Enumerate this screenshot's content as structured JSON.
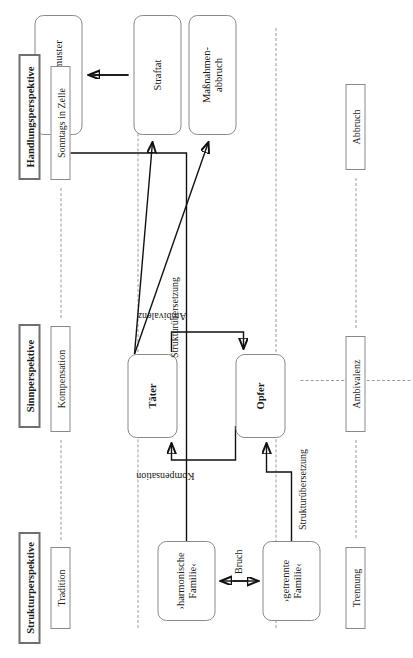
{
  "diagram": {
    "orientation": "rotated-90",
    "perspectives": [
      {
        "id": "struktur",
        "label": "Strukturperspektive"
      },
      {
        "id": "sinn",
        "label": "Sinnperspektive"
      },
      {
        "id": "handlung",
        "label": "Handlungsperspektive"
      }
    ],
    "left_chips": [
      {
        "id": "tradition",
        "label": "Tradition"
      },
      {
        "id": "kompensation-chip",
        "label": "Kompensation"
      },
      {
        "id": "sonntags",
        "label": "Sonntags in Zelle"
      }
    ],
    "right_chips": [
      {
        "id": "trennung",
        "label": "Trennung"
      },
      {
        "id": "ambivalenz-chip",
        "label": "Ambivalenz"
      },
      {
        "id": "abbruch",
        "label": "Abbruch"
      }
    ],
    "nodes": [
      {
        "id": "harmonische-familie",
        "label": "›harmonische Familie‹",
        "bold": false,
        "lines": [
          "›harmonische",
          "Familie‹"
        ]
      },
      {
        "id": "getrennte-familie",
        "label": "›getrennte Familie‹",
        "bold": false,
        "lines": [
          "›getrennte",
          "Familie‹"
        ]
      },
      {
        "id": "opfer",
        "label": "Opfer",
        "bold": true,
        "lines": [
          "Opfer"
        ]
      },
      {
        "id": "taeter",
        "label": "Täter",
        "bold": true,
        "lines": [
          "Täter"
        ]
      },
      {
        "id": "isolationsmuster",
        "label": "Isolationsmuster",
        "bold": false,
        "lines": [
          "Isolationsmuster"
        ]
      },
      {
        "id": "straftat",
        "label": "Straftat",
        "bold": false,
        "lines": [
          "Straftat"
        ]
      },
      {
        "id": "massnahmenabbruch",
        "label": "Maßnahmen-abbruch",
        "bold": false,
        "lines": [
          "Maßnahmen-",
          "abbruch"
        ]
      }
    ],
    "edge_labels": [
      {
        "id": "bruch",
        "label": "Bruch"
      },
      {
        "id": "strukturuebersetzung-links",
        "label": "Strukturübersetzung"
      },
      {
        "id": "strukturuebersetzung-rechts",
        "label": "Strukturübersetzung"
      },
      {
        "id": "kompensation",
        "label": "Kompensation"
      },
      {
        "id": "ambivalenz",
        "label": "Ambivalenz"
      }
    ],
    "colors": {
      "node_border": "#8a8a8a",
      "perspective_border": "#6f6f6f",
      "dashed": "#9a9a9a",
      "wire": "#111111",
      "background": "#ffffff",
      "text": "#1a1a1a"
    }
  }
}
